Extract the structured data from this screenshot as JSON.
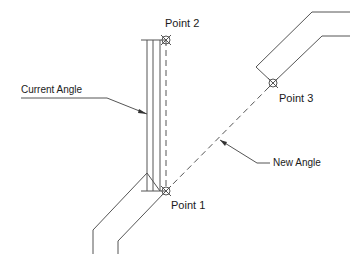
{
  "diagram": {
    "labels": {
      "point1": "Point 1",
      "point2": "Point 2",
      "point3": "Point 3",
      "current_angle": "Current Angle",
      "new_angle": "New Angle"
    },
    "colors": {
      "line": "#555555",
      "text": "#1a1a1a",
      "background": "#ffffff"
    },
    "points": {
      "point1": [
        166,
        191
      ],
      "point2": [
        166,
        40
      ],
      "point3": [
        273,
        83
      ]
    }
  }
}
